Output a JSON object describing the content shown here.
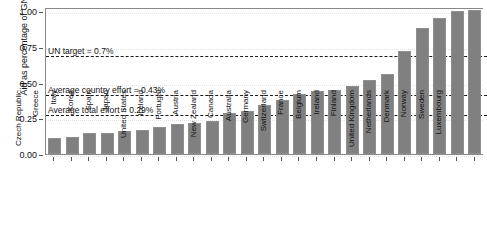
{
  "chart_data": {
    "type": "bar",
    "title": "",
    "xlabel": "",
    "ylabel": "Aid as percentage of GNI",
    "ylim": [
      0,
      1.03
    ],
    "yticks": [
      0.0,
      0.25,
      0.5,
      0.75,
      1.0
    ],
    "ytick_labels": [
      "0.00",
      "0.25",
      "0.50",
      "0.75",
      "1.00"
    ],
    "grid": false,
    "legend": "none",
    "categories": [
      "Czech Republic",
      "Greece",
      "Italy",
      "Korea",
      "Spain",
      "Japan",
      "United States",
      "Iceland",
      "Portugal",
      "Austria",
      "New Zealand",
      "Canada",
      "Australia",
      "Germany",
      "Switzerland",
      "France",
      "Belgium",
      "Ireland",
      "Finland",
      "United Kingdom",
      "Netherlands",
      "Denmark",
      "Norway",
      "Sweden",
      "Luxembourg"
    ],
    "values": [
      0.11,
      0.12,
      0.15,
      0.15,
      0.16,
      0.17,
      0.19,
      0.21,
      0.22,
      0.23,
      0.29,
      0.3,
      0.34,
      0.38,
      0.42,
      0.44,
      0.45,
      0.48,
      0.52,
      0.56,
      0.72,
      0.88,
      0.95,
      1.0,
      1.01
    ],
    "annotations": [
      {
        "label": "UN target = 0.7%",
        "value": 0.7
      },
      {
        "label": "Average country effort = 0.43%",
        "value": 0.43
      },
      {
        "label": "Average total effort = 0.29%",
        "value": 0.29
      }
    ],
    "colors": {
      "bar": "#808080",
      "bar_edge": "#8f8f8f",
      "reference_line": "#1a1a1a",
      "axis": "#888888",
      "text": "#111111",
      "background": "#ffffff"
    }
  }
}
